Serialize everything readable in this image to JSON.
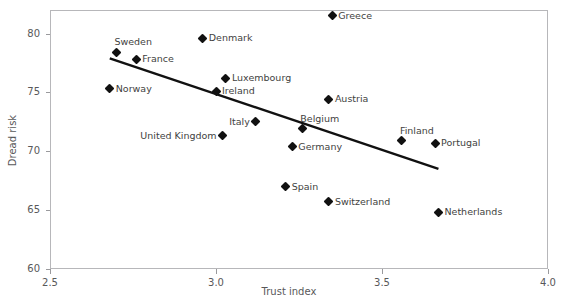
{
  "figure": {
    "top_caption_sliver": "",
    "background": "#ffffff",
    "frame_color": "#b7b7ba",
    "marker_color": "#111111",
    "trendline_color": "#111111",
    "text_color": "#58585a"
  },
  "chart_data": {
    "type": "scatter",
    "title": "",
    "xlabel": "Trust index",
    "ylabel": "Dread risk",
    "xlim": [
      2.5,
      4.0
    ],
    "ylim": [
      60,
      82
    ],
    "xticks": [
      "2.5",
      "3.0",
      "3.5",
      "4.0"
    ],
    "xtick_values": [
      2.5,
      3.0,
      3.5,
      4.0
    ],
    "yticks": [
      "60",
      "65",
      "70",
      "75",
      "80"
    ],
    "ytick_values": [
      60,
      65,
      70,
      75,
      80
    ],
    "grid": false,
    "legend": "none",
    "points": [
      {
        "label": "Sweden",
        "x": 2.7,
        "y": 78.4,
        "label_pos": "above"
      },
      {
        "label": "France",
        "x": 2.76,
        "y": 77.8,
        "label_pos": "right"
      },
      {
        "label": "Norway",
        "x": 2.68,
        "y": 75.3,
        "label_pos": "right"
      },
      {
        "label": "Denmark",
        "x": 2.96,
        "y": 79.6,
        "label_pos": "right"
      },
      {
        "label": "Greece",
        "x": 3.35,
        "y": 81.5,
        "label_pos": "right"
      },
      {
        "label": "Luxembourg",
        "x": 3.03,
        "y": 76.2,
        "label_pos": "right"
      },
      {
        "label": "Ireland",
        "x": 3.0,
        "y": 75.1,
        "label_pos": "right"
      },
      {
        "label": "Austria",
        "x": 3.34,
        "y": 74.4,
        "label_pos": "right"
      },
      {
        "label": "Italy",
        "x": 3.12,
        "y": 72.5,
        "label_pos": "left"
      },
      {
        "label": "Belgium",
        "x": 3.26,
        "y": 71.9,
        "label_pos": "above"
      },
      {
        "label": "United Kingdom",
        "x": 3.02,
        "y": 71.3,
        "label_pos": "left"
      },
      {
        "label": "Germany",
        "x": 3.23,
        "y": 70.4,
        "label_pos": "right"
      },
      {
        "label": "Finland",
        "x": 3.56,
        "y": 70.9,
        "label_pos": "above"
      },
      {
        "label": "Portugal",
        "x": 3.66,
        "y": 70.7,
        "label_pos": "right"
      },
      {
        "label": "Spain",
        "x": 3.21,
        "y": 67.0,
        "label_pos": "right"
      },
      {
        "label": "Switzerland",
        "x": 3.34,
        "y": 65.7,
        "label_pos": "right"
      },
      {
        "label": "Netherlands",
        "x": 3.67,
        "y": 64.8,
        "label_pos": "right"
      }
    ],
    "trendline": {
      "x_start": 2.68,
      "y_start": 77.9,
      "x_end": 3.67,
      "y_end": 68.5,
      "width_px": 2.4
    }
  }
}
